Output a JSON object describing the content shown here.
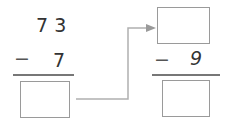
{
  "left_problem": {
    "minuend": "7 3",
    "operator": "−",
    "subtrahend": "7",
    "answer": ""
  },
  "right_problem": {
    "minuend": "",
    "operator": "−",
    "subtrahend": "9",
    "answer": ""
  },
  "connector": {
    "type": "arrow",
    "from": "left-answer-box",
    "to": "right-minuend-box",
    "color": "#a8a8a8"
  }
}
